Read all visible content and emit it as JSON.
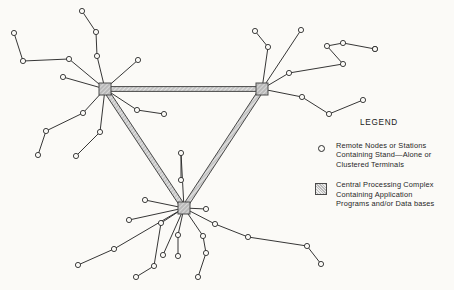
{
  "diagram": {
    "title_semantic": "distributed-network-topology",
    "background_color": "#fbfaf7",
    "line_color": "#2b2b2b",
    "hub_fill": "#b9b9b9",
    "hub_stroke": "#4a4a4a",
    "trunk_color": "#6f6f6f",
    "leaf_radius": 2.6,
    "hub_size": 12,
    "hubs": [
      {
        "id": "hub-left",
        "name": "central-processing-complex-left",
        "x": 105,
        "y": 89
      },
      {
        "id": "hub-right",
        "name": "central-processing-complex-right",
        "x": 262,
        "y": 89
      },
      {
        "id": "hub-bottom",
        "name": "central-processing-complex-bottom",
        "x": 184,
        "y": 208
      }
    ],
    "trunks": [
      {
        "from": "hub-left",
        "to": "hub-right",
        "name": "trunk-link-left-right"
      },
      {
        "from": "hub-left",
        "to": "hub-bottom",
        "name": "trunk-link-left-bottom"
      },
      {
        "from": "hub-right",
        "to": "hub-bottom",
        "name": "trunk-link-right-bottom"
      }
    ],
    "leaf_nodes": [
      {
        "id": "L1",
        "x": 82,
        "y": 11
      },
      {
        "id": "L2",
        "x": 96,
        "y": 32
      },
      {
        "id": "L3",
        "x": 97,
        "y": 56
      },
      {
        "id": "L4",
        "x": 14,
        "y": 33
      },
      {
        "id": "L5",
        "x": 23,
        "y": 61
      },
      {
        "id": "L6",
        "x": 63,
        "y": 77
      },
      {
        "id": "L7",
        "x": 69,
        "y": 59
      },
      {
        "id": "L8",
        "x": 138,
        "y": 60
      },
      {
        "id": "L9",
        "x": 46,
        "y": 131
      },
      {
        "id": "L10",
        "x": 83,
        "y": 113
      },
      {
        "id": "L11",
        "x": 38,
        "y": 155
      },
      {
        "id": "L12",
        "x": 100,
        "y": 132
      },
      {
        "id": "L13",
        "x": 76,
        "y": 156
      },
      {
        "id": "L14",
        "x": 137,
        "y": 110
      },
      {
        "id": "L15",
        "x": 164,
        "y": 114
      },
      {
        "id": "L16",
        "x": 255,
        "y": 31
      },
      {
        "id": "L17",
        "x": 268,
        "y": 47
      },
      {
        "id": "L18",
        "x": 301,
        "y": 30
      },
      {
        "id": "L19",
        "x": 289,
        "y": 73
      },
      {
        "id": "L20",
        "x": 327,
        "y": 46
      },
      {
        "id": "L21",
        "x": 343,
        "y": 43
      },
      {
        "id": "L22",
        "x": 375,
        "y": 49
      },
      {
        "id": "L23",
        "x": 343,
        "y": 64
      },
      {
        "id": "L24",
        "x": 375,
        "y": 49
      },
      {
        "id": "L25",
        "x": 302,
        "y": 97
      },
      {
        "id": "L26",
        "x": 329,
        "y": 114
      },
      {
        "id": "L27",
        "x": 363,
        "y": 100
      },
      {
        "id": "L28",
        "x": 181,
        "y": 153
      },
      {
        "id": "L29",
        "x": 181,
        "y": 180
      },
      {
        "id": "L30",
        "x": 145,
        "y": 200
      },
      {
        "id": "L31",
        "x": 206,
        "y": 209
      },
      {
        "id": "L32",
        "x": 129,
        "y": 220
      },
      {
        "id": "L33",
        "x": 215,
        "y": 224
      },
      {
        "id": "L34",
        "x": 248,
        "y": 237
      },
      {
        "id": "L35",
        "x": 307,
        "y": 246
      },
      {
        "id": "L36",
        "x": 321,
        "y": 264
      },
      {
        "id": "L37",
        "x": 114,
        "y": 249
      },
      {
        "id": "L38",
        "x": 78,
        "y": 265
      },
      {
        "id": "L39",
        "x": 161,
        "y": 223
      },
      {
        "id": "L40",
        "x": 163,
        "y": 255
      },
      {
        "id": "L41",
        "x": 154,
        "y": 266
      },
      {
        "id": "L42",
        "x": 136,
        "y": 277
      },
      {
        "id": "L43",
        "x": 178,
        "y": 235
      },
      {
        "id": "L44",
        "x": 178,
        "y": 256
      },
      {
        "id": "L45",
        "x": 203,
        "y": 236
      },
      {
        "id": "L46",
        "x": 206,
        "y": 253
      },
      {
        "id": "L47",
        "x": 198,
        "y": 277
      }
    ],
    "spokes": [
      {
        "from": "hub-left",
        "to": "L3"
      },
      {
        "from": "L3",
        "to": "L2"
      },
      {
        "from": "L2",
        "to": "L1"
      },
      {
        "from": "hub-left",
        "to": "L7"
      },
      {
        "from": "L7",
        "to": "L5"
      },
      {
        "from": "L5",
        "to": "L4"
      },
      {
        "from": "hub-left",
        "to": "L6"
      },
      {
        "from": "hub-left",
        "to": "L8"
      },
      {
        "from": "hub-left",
        "to": "L10"
      },
      {
        "from": "L10",
        "to": "L9"
      },
      {
        "from": "L9",
        "to": "L11"
      },
      {
        "from": "hub-left",
        "to": "L12"
      },
      {
        "from": "L12",
        "to": "L13"
      },
      {
        "from": "hub-left",
        "to": "L14"
      },
      {
        "from": "L14",
        "to": "L15"
      },
      {
        "from": "hub-right",
        "to": "L17"
      },
      {
        "from": "L17",
        "to": "L16"
      },
      {
        "from": "hub-right",
        "to": "L18"
      },
      {
        "from": "hub-right",
        "to": "L19"
      },
      {
        "from": "L19",
        "to": "L23"
      },
      {
        "from": "L23",
        "to": "L20"
      },
      {
        "from": "L20",
        "to": "L21"
      },
      {
        "from": "L21",
        "to": "L22"
      },
      {
        "from": "hub-right",
        "to": "L25"
      },
      {
        "from": "L25",
        "to": "L26"
      },
      {
        "from": "L26",
        "to": "L27"
      },
      {
        "from": "hub-bottom",
        "to": "L28"
      },
      {
        "from": "L28",
        "to": "L29"
      },
      {
        "from": "hub-bottom",
        "to": "L30"
      },
      {
        "from": "hub-bottom",
        "to": "L31"
      },
      {
        "from": "hub-bottom",
        "to": "L32"
      },
      {
        "from": "hub-bottom",
        "to": "L33"
      },
      {
        "from": "L33",
        "to": "L34"
      },
      {
        "from": "L34",
        "to": "L35"
      },
      {
        "from": "L35",
        "to": "L36"
      },
      {
        "from": "hub-bottom",
        "to": "L37"
      },
      {
        "from": "L37",
        "to": "L38"
      },
      {
        "from": "hub-bottom",
        "to": "L39"
      },
      {
        "from": "L39",
        "to": "L41"
      },
      {
        "from": "L41",
        "to": "L42"
      },
      {
        "from": "hub-bottom",
        "to": "L43"
      },
      {
        "from": "L43",
        "to": "L44"
      },
      {
        "from": "hub-bottom",
        "to": "L45"
      },
      {
        "from": "L45",
        "to": "L46"
      },
      {
        "from": "L46",
        "to": "L47"
      },
      {
        "from": "hub-bottom",
        "to": "L40"
      }
    ]
  },
  "legend": {
    "title": "LEGEND",
    "entries": [
      {
        "symbol": "open-circle",
        "lines": [
          "Remote Nodes or Stations",
          "Containing Stand—Alone or",
          "Clustered Terminals"
        ]
      },
      {
        "symbol": "hatched-square",
        "lines": [
          "Central Processing Complex",
          "Containing Application",
          "Programs and/or Data bases"
        ]
      }
    ]
  }
}
